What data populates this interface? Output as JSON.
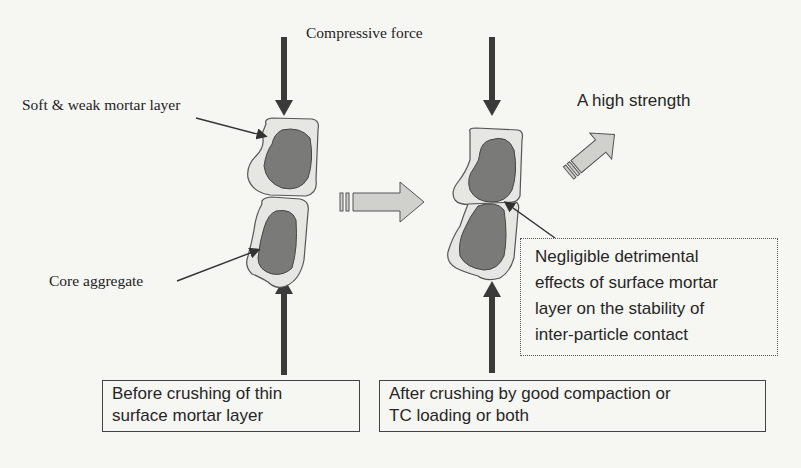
{
  "diagram": {
    "title_label": "Compressive force",
    "labels": {
      "mortar_layer": "Soft & weak mortar layer",
      "core_aggregate": "Core aggregate",
      "result": "A high strength"
    },
    "boxes": {
      "before": {
        "lines": [
          "Before crushing of thin",
          "surface mortar layer"
        ]
      },
      "after": {
        "lines": [
          "After crushing by good compaction or",
          "TC loading or both"
        ]
      },
      "effect": {
        "lines": [
          "Negligible detrimental",
          "effects of surface mortar",
          "layer on the stability of",
          "inter-particle contact"
        ]
      }
    },
    "colors": {
      "background": "#f6f6f3",
      "arrow_dark": "#3a3a3a",
      "mortar_fill": "#e6e6e2",
      "core_fill": "#7a7a78",
      "block_arrow_fill": "#d0d0cc",
      "outline": "#555555"
    }
  }
}
